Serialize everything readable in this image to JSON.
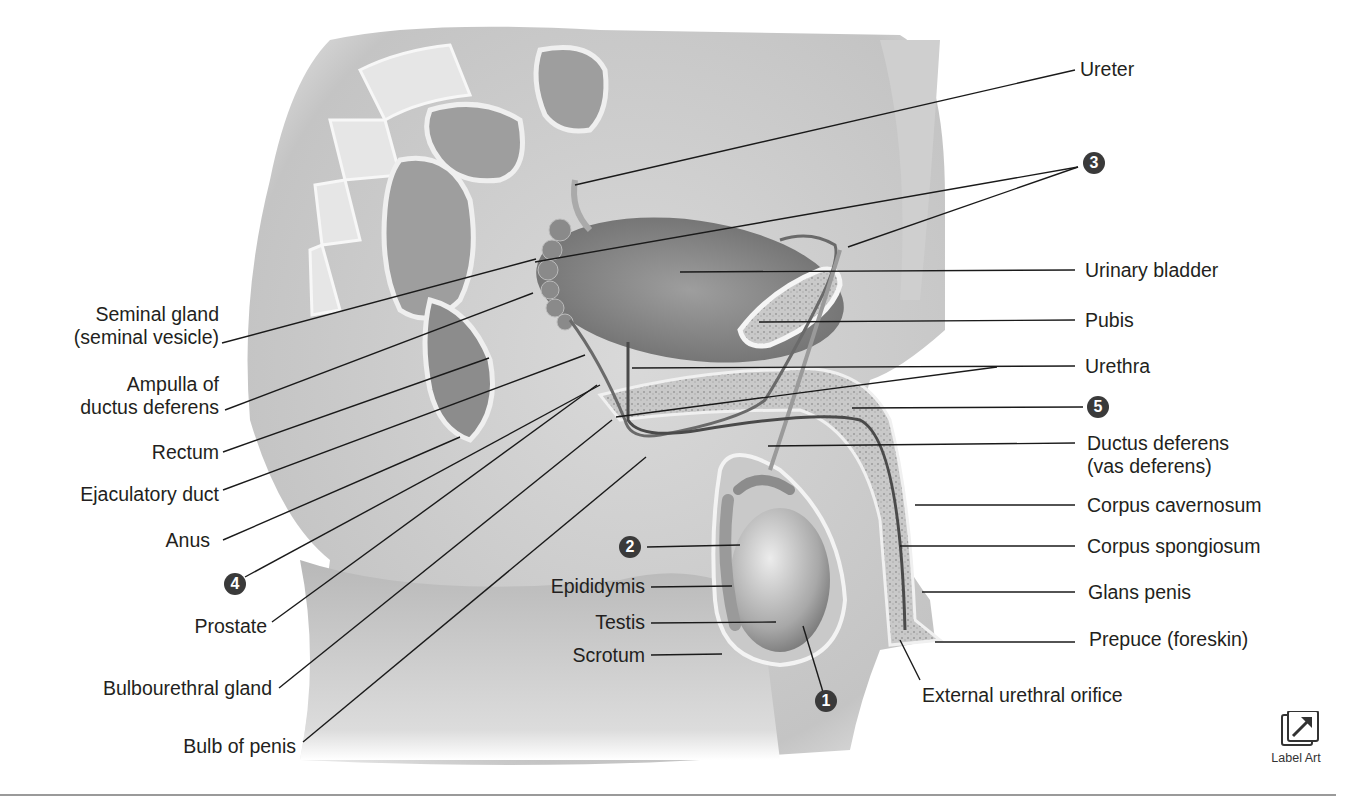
{
  "figure": {
    "left_labels": [
      {
        "id": "seminal-gland",
        "lines": [
          "Seminal gland",
          "(seminal vesicle)"
        ]
      },
      {
        "id": "ampulla",
        "lines": [
          "Ampulla of",
          "ductus deferens"
        ]
      },
      {
        "id": "rectum",
        "lines": [
          "Rectum"
        ]
      },
      {
        "id": "ejaculatory-duct",
        "lines": [
          "Ejaculatory duct"
        ]
      },
      {
        "id": "anus",
        "lines": [
          "Anus"
        ]
      },
      {
        "id": "prostate",
        "lines": [
          "Prostate"
        ]
      },
      {
        "id": "bulbourethral-gland",
        "lines": [
          "Bulbourethral gland"
        ]
      },
      {
        "id": "bulb-of-penis",
        "lines": [
          "Bulb of penis"
        ]
      }
    ],
    "center_labels": [
      {
        "id": "epididymis",
        "text": "Epididymis"
      },
      {
        "id": "testis",
        "text": "Testis"
      },
      {
        "id": "scrotum",
        "text": "Scrotum"
      },
      {
        "id": "external-urethral-orifice",
        "text": "External urethral orifice"
      }
    ],
    "right_labels": [
      {
        "id": "ureter",
        "lines": [
          "Ureter"
        ]
      },
      {
        "id": "urinary-bladder",
        "lines": [
          "Urinary bladder"
        ]
      },
      {
        "id": "pubis",
        "lines": [
          "Pubis"
        ]
      },
      {
        "id": "urethra",
        "lines": [
          "Urethra"
        ]
      },
      {
        "id": "ductus-deferens",
        "lines": [
          "Ductus deferens",
          "(vas deferens)"
        ]
      },
      {
        "id": "corpus-cavernosum",
        "lines": [
          "Corpus cavernosum"
        ]
      },
      {
        "id": "corpus-spongiosum",
        "lines": [
          "Corpus spongiosum"
        ]
      },
      {
        "id": "glans-penis",
        "lines": [
          "Glans penis"
        ]
      },
      {
        "id": "prepuce",
        "lines": [
          "Prepuce (foreskin)"
        ]
      }
    ],
    "numbered_markers": [
      "1",
      "2",
      "3",
      "4",
      "5"
    ]
  },
  "toolbar": {
    "label_art_button": "Label Art"
  },
  "colors": {
    "marker_fill": "#3a3a3a",
    "text": "#231f20",
    "leader_line": "#1a1a1a"
  }
}
